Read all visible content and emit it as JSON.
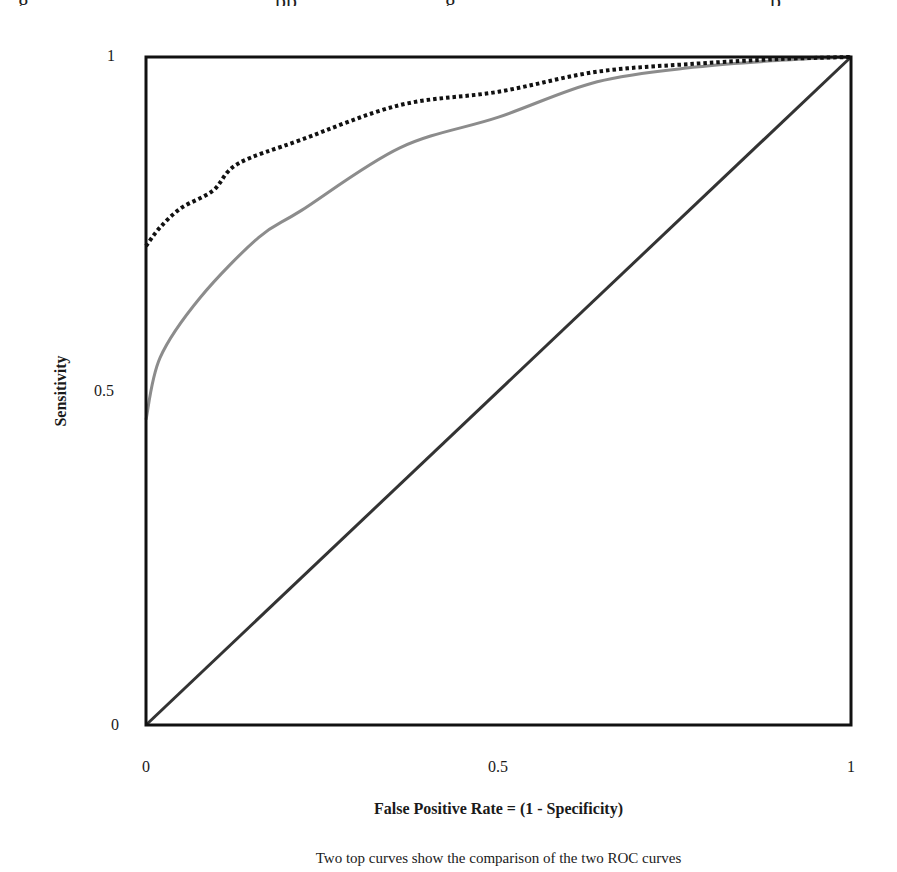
{
  "chart_data": {
    "type": "line",
    "title": "",
    "xlabel": "False Positive Rate = (1 - Specificity)",
    "ylabel": "Sensitivity",
    "caption": "Two top curves show the comparison of the two ROC curves",
    "xlim": [
      0,
      1
    ],
    "ylim": [
      0,
      1
    ],
    "x_ticks": [
      "0",
      "0.5",
      "1"
    ],
    "y_ticks": [
      "0",
      "0.5",
      "1"
    ],
    "grid": false,
    "legend": null,
    "series": [
      {
        "name": "ROC curve (dotted, black)",
        "style": "dotted",
        "color": "#111111",
        "x": [
          0,
          0.02,
          0.05,
          0.095,
          0.13,
          0.22,
          0.36,
          0.5,
          0.64,
          0.78,
          0.9,
          1
        ],
        "y": [
          0.717,
          0.745,
          0.774,
          0.8,
          0.84,
          0.876,
          0.928,
          0.948,
          0.978,
          0.99,
          0.997,
          1
        ]
      },
      {
        "name": "ROC curve (solid, gray)",
        "style": "solid",
        "color": "#8c8c8c",
        "x": [
          0,
          0.02,
          0.077,
          0.16,
          0.22,
          0.36,
          0.5,
          0.64,
          0.78,
          0.9,
          1
        ],
        "y": [
          0.457,
          0.55,
          0.64,
          0.73,
          0.77,
          0.864,
          0.91,
          0.963,
          0.985,
          0.995,
          1
        ]
      },
      {
        "name": "Chance diagonal",
        "style": "solid",
        "color": "#333333",
        "x": [
          0,
          1
        ],
        "y": [
          0,
          1
        ]
      }
    ]
  },
  "page": {
    "top_strip_fragments": [
      "g",
      "pp",
      "g",
      "p"
    ]
  }
}
